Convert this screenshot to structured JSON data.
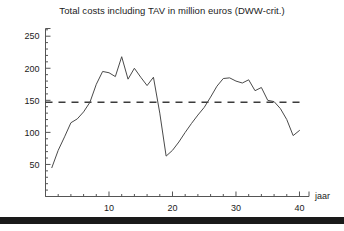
{
  "figure": {
    "background_color": "#ffffff",
    "line_color": "#4a4a4a",
    "axis_color": "#555555",
    "text_color": "#1b1b1b",
    "bottom_band_color": "#1a1a1a"
  },
  "chart_data": {
    "type": "line",
    "title": "Total costs including TAV in million euros (DWW-crit.)",
    "xlabel": "jaar",
    "ylabel": "",
    "xlim": [
      0,
      41.5
    ],
    "ylim": [
      0,
      262
    ],
    "xticks": [
      10,
      20,
      30,
      40
    ],
    "xtick_labels": [
      "10",
      "20",
      "30",
      "40"
    ],
    "x_minor_tick_step": 2,
    "yticks": [
      50,
      100,
      150,
      200,
      250
    ],
    "ytick_labels": [
      "50",
      "100",
      "150",
      "200",
      "250"
    ],
    "y_minor_tick_step": 10,
    "grid": false,
    "legend": false,
    "x": [
      1,
      2,
      3,
      4,
      5,
      6,
      7,
      8,
      9,
      10,
      11,
      12,
      13,
      14,
      15,
      16,
      17,
      18,
      19,
      20,
      21,
      22,
      23,
      24,
      25,
      26,
      27,
      28,
      29,
      30,
      31,
      32,
      33,
      34,
      35,
      36,
      37,
      38,
      39,
      40
    ],
    "values": [
      45,
      72,
      93,
      115,
      121,
      132,
      147,
      175,
      195,
      193,
      187,
      218,
      183,
      200,
      186,
      173,
      186,
      130,
      63,
      72,
      85,
      100,
      114,
      127,
      139,
      155,
      172,
      184,
      185,
      180,
      177,
      182,
      165,
      170,
      150,
      148,
      137,
      120,
      95,
      103
    ],
    "reference_lines": [
      {
        "name": "dww-criterion",
        "orientation": "horizontal",
        "value": 147,
        "style": "dashed",
        "color": "#3b3b3b"
      }
    ],
    "series": [
      {
        "name": "Total costs including TAV",
        "values": [
          45,
          72,
          93,
          115,
          121,
          132,
          147,
          175,
          195,
          193,
          187,
          218,
          183,
          200,
          186,
          173,
          186,
          130,
          63,
          72,
          85,
          100,
          114,
          127,
          139,
          155,
          172,
          184,
          185,
          180,
          177,
          182,
          165,
          170,
          150,
          148,
          137,
          120,
          95,
          103
        ]
      }
    ]
  }
}
